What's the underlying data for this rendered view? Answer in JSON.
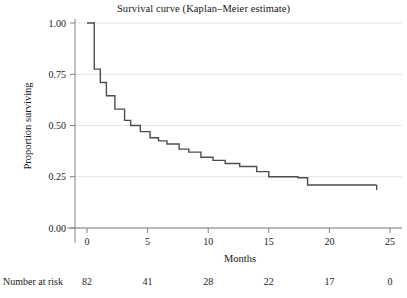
{
  "chart_data": {
    "type": "line",
    "title": "Survival curve (Kaplan–Meier estimate)",
    "xlabel": "Months",
    "ylabel": "Proportion surviving",
    "xlim": [
      -0.6,
      25.4
    ],
    "ylim": [
      0.0,
      1.0
    ],
    "grid": true,
    "legend": null,
    "xticks": [
      0,
      5,
      10,
      15,
      20,
      25
    ],
    "xtick_labels": [
      "0",
      "5",
      "10",
      "15",
      "20",
      "25"
    ],
    "yticks": [
      0.0,
      0.25,
      0.5,
      0.75,
      1.0
    ],
    "ytick_labels": [
      "0.00",
      "0.25",
      "0.50",
      "0.75",
      "1.00"
    ],
    "series": [
      {
        "name": "Kaplan-Meier survival estimate",
        "style": "step-post",
        "color": "#4d4d4d",
        "x": [
          0.0,
          0.6,
          1.1,
          1.6,
          2.3,
          3.1,
          3.6,
          4.4,
          5.2,
          5.9,
          6.6,
          7.6,
          8.4,
          9.4,
          10.4,
          11.4,
          12.6,
          14.0,
          15.0,
          17.4,
          18.2,
          23.9
        ],
        "y": [
          1.0,
          0.775,
          0.71,
          0.645,
          0.58,
          0.525,
          0.5,
          0.47,
          0.44,
          0.425,
          0.41,
          0.385,
          0.37,
          0.345,
          0.33,
          0.315,
          0.3,
          0.275,
          0.25,
          0.245,
          0.21,
          0.21
        ],
        "terminal_tick": {
          "x": 23.9,
          "y_from": 0.21,
          "y_to": 0.185
        }
      }
    ],
    "risk_table": {
      "label": "Number at risk",
      "times": [
        0,
        5,
        10,
        15,
        20,
        25
      ],
      "counts": [
        "82",
        "41",
        "28",
        "22",
        "17",
        "0"
      ]
    }
  },
  "colors": {
    "axis": "#808080",
    "grid": "#e3e3e3",
    "curve": "#4d4d4d",
    "text": "#1a1a1a",
    "background": "#ffffff"
  }
}
